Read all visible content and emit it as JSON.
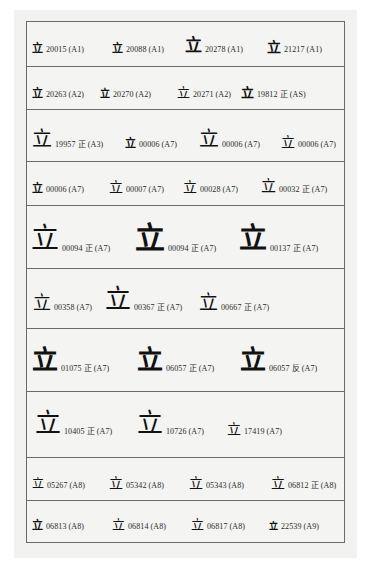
{
  "glyph_char": "立",
  "rows": [
    {
      "entries": [
        {
          "id": "20015",
          "note": "",
          "tag": "(A1)"
        },
        {
          "id": "20088",
          "note": "",
          "tag": "(A1)"
        },
        {
          "id": "20278",
          "note": "",
          "tag": "(A1)"
        },
        {
          "id": "21217",
          "note": "",
          "tag": "(A1)"
        }
      ]
    },
    {
      "entries": [
        {
          "id": "20263",
          "note": "",
          "tag": "(A2)"
        },
        {
          "id": "20270",
          "note": "",
          "tag": "(A2)"
        },
        {
          "id": "20271",
          "note": "",
          "tag": "(A2)"
        },
        {
          "id": "19812",
          "note": "正",
          "tag": "(AS)"
        }
      ]
    },
    {
      "entries": [
        {
          "id": "19957",
          "note": "正",
          "tag": "(A3)"
        },
        {
          "id": "00006",
          "note": "",
          "tag": "(A7)"
        },
        {
          "id": "00006",
          "note": "",
          "tag": "(A7)"
        },
        {
          "id": "00006",
          "note": "",
          "tag": "(A7)"
        }
      ]
    },
    {
      "entries": [
        {
          "id": "00006",
          "note": "",
          "tag": "(A7)"
        },
        {
          "id": "00007",
          "note": "",
          "tag": "(A7)"
        },
        {
          "id": "00028",
          "note": "",
          "tag": "(A7)"
        },
        {
          "id": "00032",
          "note": "正",
          "tag": "(A7)"
        }
      ]
    },
    {
      "entries": [
        {
          "id": "00094",
          "note": "正",
          "tag": "(A7)"
        },
        {
          "id": "00094",
          "note": "正",
          "tag": "(A7)"
        },
        {
          "id": "00137",
          "note": "正",
          "tag": "(A7)"
        }
      ]
    },
    {
      "entries": [
        {
          "id": "00358",
          "note": "",
          "tag": "(A7)"
        },
        {
          "id": "00367",
          "note": "正",
          "tag": "(A7)"
        },
        {
          "id": "00667",
          "note": "正",
          "tag": "(A7)"
        }
      ]
    },
    {
      "entries": [
        {
          "id": "01075",
          "note": "正",
          "tag": "(A7)"
        },
        {
          "id": "06057",
          "note": "正",
          "tag": "(A7)"
        },
        {
          "id": "06057",
          "note": "反",
          "tag": "(A7)"
        }
      ]
    },
    {
      "entries": [
        {
          "id": "10405",
          "note": "正",
          "tag": "(A7)"
        },
        {
          "id": "10726",
          "note": "",
          "tag": "(A7)"
        },
        {
          "id": "17419",
          "note": "",
          "tag": "(A7)"
        }
      ]
    },
    {
      "entries": [
        {
          "id": "05267",
          "note": "",
          "tag": "(A8)"
        },
        {
          "id": "05342",
          "note": "",
          "tag": "(A8)"
        },
        {
          "id": "05343",
          "note": "",
          "tag": "(A8)"
        },
        {
          "id": "06812",
          "note": "正",
          "tag": "(A8)"
        }
      ]
    },
    {
      "entries": [
        {
          "id": "06813",
          "note": "",
          "tag": "(A8)"
        },
        {
          "id": "06814",
          "note": "",
          "tag": "(A8)"
        },
        {
          "id": "06817",
          "note": "",
          "tag": "(A8)"
        },
        {
          "id": "22539",
          "note": "",
          "tag": "(A9)"
        }
      ]
    }
  ]
}
